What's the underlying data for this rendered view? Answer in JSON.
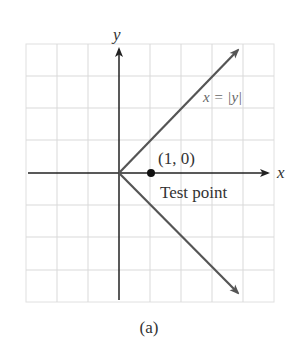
{
  "figure": {
    "caption": "(a)",
    "axes": {
      "x_label": "x",
      "y_label": "y"
    },
    "curve": {
      "label": "x = |y|",
      "color": "#555555"
    },
    "test_point": {
      "coords_label": "(1, 0)",
      "name_label": "Test point",
      "x": 1,
      "y": 0
    },
    "grid": {
      "x_range": [
        -3,
        5
      ],
      "y_range": [
        -4,
        4
      ],
      "color": "#d9d9d9"
    },
    "colors": {
      "axis": "#222222",
      "text": "#333333",
      "curve_label": "#666666"
    }
  }
}
